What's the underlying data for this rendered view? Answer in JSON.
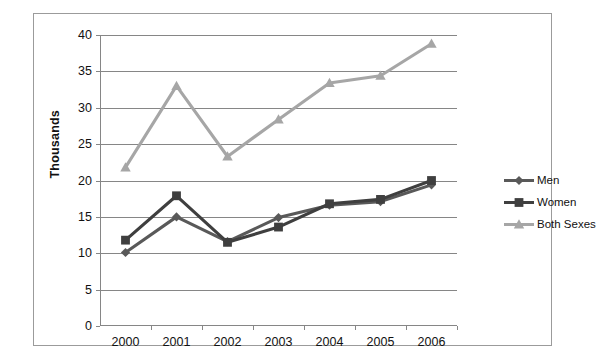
{
  "chart_data": {
    "type": "line",
    "title": "",
    "xlabel": "",
    "ylabel": "Thousands",
    "categories": [
      "2000",
      "2001",
      "2002",
      "2003",
      "2004",
      "2005",
      "2006"
    ],
    "ylim": [
      0,
      40
    ],
    "ytick_step": 5,
    "yticks": [
      "0",
      "5",
      "10",
      "15",
      "20",
      "25",
      "30",
      "35",
      "40"
    ],
    "grid": "horizontal",
    "legend_position": "right",
    "series": [
      {
        "name": "Men",
        "color": "#595959",
        "marker": "diamond",
        "values": [
          10.1,
          15.0,
          11.6,
          14.9,
          16.6,
          17.1,
          19.4
        ]
      },
      {
        "name": "Women",
        "color": "#3f3f3f",
        "marker": "square",
        "values": [
          11.8,
          17.9,
          11.5,
          13.6,
          16.8,
          17.4,
          20.0
        ]
      },
      {
        "name": "Both Sexes",
        "color": "#a6a6a6",
        "marker": "triangle",
        "values": [
          21.8,
          33.0,
          23.3,
          28.4,
          33.4,
          34.4,
          38.8
        ]
      }
    ]
  },
  "legend": {
    "items": [
      {
        "label": "Men"
      },
      {
        "label": "Women"
      },
      {
        "label": "Both Sexes"
      }
    ]
  }
}
